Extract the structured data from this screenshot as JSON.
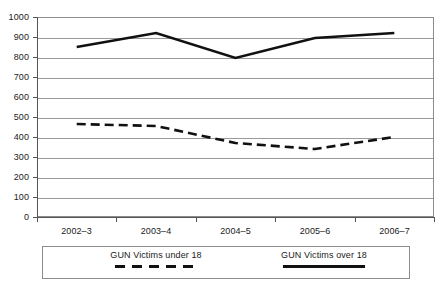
{
  "chart_data": {
    "type": "line",
    "title": "",
    "subtitle": "",
    "xlabel": "",
    "ylabel": "",
    "categories": [
      "2002–3",
      "2003–4",
      "2004–5",
      "2005–6",
      "2006–7"
    ],
    "ylim": [
      0,
      1000
    ],
    "ytick_step": 100,
    "yticks": [
      "1000",
      "900",
      "800",
      "700",
      "600",
      "500",
      "400",
      "300",
      "200",
      "100",
      "0"
    ],
    "grid": true,
    "grid_axis": "y",
    "legend_position": "bottom",
    "series": [
      {
        "name": "GUN Victims under 18",
        "style": "dashed",
        "color": "#111111",
        "values": [
          465,
          455,
          370,
          340,
          400
        ]
      },
      {
        "name": "GUN Victims over 18",
        "style": "solid",
        "color": "#111111",
        "values": [
          850,
          920,
          795,
          895,
          920
        ]
      }
    ]
  },
  "legend": {
    "entries": [
      {
        "label": "GUN Victims under 18",
        "style": "dashed"
      },
      {
        "label": "GUN Victims over 18",
        "style": "solid"
      }
    ]
  },
  "colors": {
    "series_line": "#111111",
    "grid": "#9a9a9a",
    "axis": "#555555",
    "frame": "#8c8c8c",
    "text": "#1a1a1a",
    "background": "#ffffff"
  }
}
